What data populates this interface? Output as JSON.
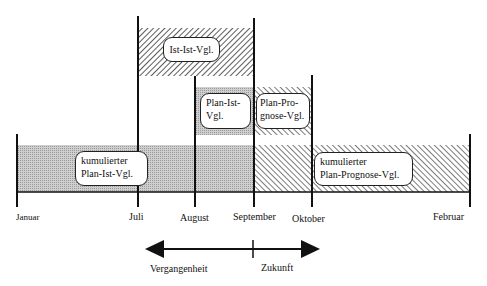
{
  "diagram": {
    "type": "timeline-comparison",
    "months": [
      {
        "label": "Januar",
        "x": 17
      },
      {
        "label": "Juli",
        "x": 138
      },
      {
        "label": "August",
        "x": 195
      },
      {
        "label": "September",
        "x": 254
      },
      {
        "label": "Oktober",
        "x": 312
      },
      {
        "label": "Februar",
        "x": 470
      }
    ],
    "bars": [
      {
        "id": "ist-ist",
        "label": "Ist-Ist-Vgl.",
        "from": "Juli",
        "to": "September",
        "pattern": "hatch-forward"
      },
      {
        "id": "plan-ist",
        "label_lines": [
          "Plan-Ist-",
          "Vgl."
        ],
        "from": "August",
        "to": "September",
        "pattern": "gray-dotted"
      },
      {
        "id": "plan-prognose",
        "label_lines": [
          "Plan-Pro-",
          "gnose-Vgl."
        ],
        "from": "September",
        "to": "Oktober",
        "pattern": "hatch-backward"
      },
      {
        "id": "kum-plan-ist",
        "label_lines": [
          "kumulierter",
          "Plan-Ist-Vgl."
        ],
        "from": "Januar",
        "to": "September",
        "pattern": "gray-dotted"
      },
      {
        "id": "kum-plan-prognose",
        "label_lines": [
          "kumulierter",
          "Plan-Prognose-Vgl."
        ],
        "from": "September",
        "to": "Februar",
        "pattern": "hatch-backward"
      }
    ],
    "time_arrow": {
      "past_label": "Vergangenheit",
      "future_label": "Zukunft",
      "divider_at": "September"
    }
  },
  "colors": {
    "line": "#111111",
    "gray_fill": "#c4c4c4",
    "hatch": "#333333",
    "background": "#ffffff"
  }
}
